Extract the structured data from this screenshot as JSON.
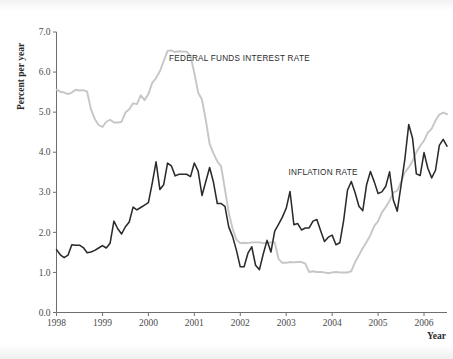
{
  "chart_data": {
    "type": "line",
    "title": "",
    "xlabel": "Year",
    "ylabel": "Percent per year",
    "xlim": [
      1998.0,
      2006.5
    ],
    "ylim": [
      0.0,
      7.0
    ],
    "grid": false,
    "legend_position": "inline-annotation",
    "y_ticks": [
      "0.0",
      "1.0",
      "2.0",
      "3.0",
      "4.0",
      "5.0",
      "6.0",
      "7.0"
    ],
    "y_tick_values": [
      0.0,
      1.0,
      2.0,
      3.0,
      4.0,
      5.0,
      6.0,
      7.0
    ],
    "x_ticks": [
      "1998",
      "1999",
      "2000",
      "2001",
      "2002",
      "2003",
      "2004",
      "2005",
      "2006"
    ],
    "x_tick_values": [
      1998,
      1999,
      2000,
      2001,
      2002,
      2003,
      2004,
      2005,
      2006
    ],
    "annotations": [
      {
        "text": "FEDERAL FUNDS INTEREST RATE",
        "x": 2000.45,
        "y": 6.28
      },
      {
        "text": "INFLATION RATE",
        "x": 2003.05,
        "y": 3.42
      }
    ],
    "series": [
      {
        "name": "FEDERAL FUNDS INTEREST RATE",
        "color": "#c6c6c6",
        "x": [
          1998.0,
          1998.083,
          1998.167,
          1998.25,
          1998.333,
          1998.417,
          1998.5,
          1998.583,
          1998.667,
          1998.75,
          1998.833,
          1998.917,
          1999.0,
          1999.083,
          1999.167,
          1999.25,
          1999.333,
          1999.417,
          1999.5,
          1999.583,
          1999.667,
          1999.75,
          1999.833,
          1999.917,
          2000.0,
          2000.083,
          2000.167,
          2000.25,
          2000.333,
          2000.417,
          2000.5,
          2000.583,
          2000.667,
          2000.75,
          2000.833,
          2000.917,
          2001.0,
          2001.083,
          2001.167,
          2001.25,
          2001.333,
          2001.417,
          2001.5,
          2001.583,
          2001.667,
          2001.75,
          2001.833,
          2001.917,
          2002.0,
          2002.083,
          2002.167,
          2002.25,
          2002.333,
          2002.417,
          2002.5,
          2002.583,
          2002.667,
          2002.75,
          2002.833,
          2002.917,
          2003.0,
          2003.083,
          2003.167,
          2003.25,
          2003.333,
          2003.417,
          2003.5,
          2003.583,
          2003.667,
          2003.75,
          2003.833,
          2003.917,
          2004.0,
          2004.083,
          2004.167,
          2004.25,
          2004.333,
          2004.417,
          2004.5,
          2004.583,
          2004.667,
          2004.75,
          2004.833,
          2004.917,
          2005.0,
          2005.083,
          2005.167,
          2005.25,
          2005.333,
          2005.417,
          2005.5,
          2005.583,
          2005.667,
          2005.75,
          2005.833,
          2005.917,
          2006.0,
          2006.083,
          2006.167,
          2006.25,
          2006.333,
          2006.417,
          2006.5
        ],
        "values": [
          5.56,
          5.51,
          5.49,
          5.45,
          5.49,
          5.56,
          5.54,
          5.55,
          5.51,
          5.07,
          4.83,
          4.68,
          4.63,
          4.76,
          4.81,
          4.74,
          4.74,
          4.76,
          4.99,
          5.07,
          5.22,
          5.2,
          5.42,
          5.3,
          5.45,
          5.73,
          5.85,
          6.02,
          6.27,
          6.53,
          6.54,
          6.5,
          6.52,
          6.51,
          6.51,
          6.4,
          5.98,
          5.49,
          5.31,
          4.8,
          4.21,
          3.97,
          3.77,
          3.65,
          3.07,
          2.49,
          2.09,
          1.82,
          1.73,
          1.74,
          1.73,
          1.75,
          1.75,
          1.75,
          1.73,
          1.74,
          1.75,
          1.75,
          1.34,
          1.24,
          1.24,
          1.26,
          1.25,
          1.26,
          1.26,
          1.22,
          1.01,
          1.03,
          1.01,
          1.01,
          1.0,
          0.98,
          1.0,
          1.01,
          1.0,
          1.0,
          1.0,
          1.03,
          1.26,
          1.43,
          1.61,
          1.76,
          1.93,
          2.16,
          2.28,
          2.5,
          2.63,
          2.79,
          3.0,
          3.04,
          3.26,
          3.5,
          3.62,
          3.78,
          4.0,
          4.16,
          4.29,
          4.49,
          4.59,
          4.79,
          4.94,
          4.99,
          4.95
        ]
      },
      {
        "name": "INFLATION RATE",
        "color": "#2a2a2a",
        "x": [
          1998.0,
          1998.083,
          1998.167,
          1998.25,
          1998.333,
          1998.417,
          1998.5,
          1998.583,
          1998.667,
          1998.75,
          1998.833,
          1998.917,
          1999.0,
          1999.083,
          1999.167,
          1999.25,
          1999.333,
          1999.417,
          1999.5,
          1999.583,
          1999.667,
          1999.75,
          1999.833,
          1999.917,
          2000.0,
          2000.083,
          2000.167,
          2000.25,
          2000.333,
          2000.417,
          2000.5,
          2000.583,
          2000.667,
          2000.75,
          2000.833,
          2000.917,
          2001.0,
          2001.083,
          2001.167,
          2001.25,
          2001.333,
          2001.417,
          2001.5,
          2001.583,
          2001.667,
          2001.75,
          2001.833,
          2001.917,
          2002.0,
          2002.083,
          2002.167,
          2002.25,
          2002.333,
          2002.417,
          2002.5,
          2002.583,
          2002.667,
          2002.75,
          2002.833,
          2002.917,
          2003.0,
          2003.083,
          2003.167,
          2003.25,
          2003.333,
          2003.417,
          2003.5,
          2003.583,
          2003.667,
          2003.75,
          2003.833,
          2003.917,
          2004.0,
          2004.083,
          2004.167,
          2004.25,
          2004.333,
          2004.417,
          2004.5,
          2004.583,
          2004.667,
          2004.75,
          2004.833,
          2004.917,
          2005.0,
          2005.083,
          2005.167,
          2005.25,
          2005.333,
          2005.417,
          2005.5,
          2005.583,
          2005.667,
          2005.75,
          2005.833,
          2005.917,
          2006.0,
          2006.083,
          2006.167,
          2006.25,
          2006.333,
          2006.417,
          2006.5
        ],
        "values": [
          1.57,
          1.44,
          1.37,
          1.43,
          1.69,
          1.68,
          1.68,
          1.62,
          1.49,
          1.51,
          1.55,
          1.61,
          1.67,
          1.61,
          1.73,
          2.28,
          2.09,
          1.96,
          2.14,
          2.26,
          2.63,
          2.56,
          2.62,
          2.68,
          2.74,
          3.22,
          3.76,
          3.07,
          3.19,
          3.73,
          3.66,
          3.41,
          3.45,
          3.45,
          3.45,
          3.39,
          3.73,
          3.53,
          2.92,
          3.27,
          3.62,
          3.25,
          2.72,
          2.72,
          2.65,
          2.13,
          1.9,
          1.55,
          1.14,
          1.14,
          1.48,
          1.64,
          1.18,
          1.07,
          1.46,
          1.8,
          1.51,
          2.03,
          2.2,
          2.38,
          2.6,
          3.02,
          2.19,
          2.22,
          2.06,
          2.11,
          2.11,
          2.28,
          2.32,
          2.04,
          1.77,
          1.88,
          1.93,
          1.69,
          1.74,
          2.29,
          3.05,
          3.27,
          2.99,
          2.65,
          2.54,
          3.19,
          3.52,
          3.26,
          2.97,
          3.01,
          3.15,
          3.51,
          2.8,
          2.53,
          3.17,
          3.83,
          4.69,
          4.35,
          3.46,
          3.42,
          3.99,
          3.6,
          3.36,
          3.55,
          4.17,
          4.32,
          4.15
        ]
      }
    ]
  },
  "axis": {
    "y_label": "Percent per year",
    "x_label": "Year"
  }
}
